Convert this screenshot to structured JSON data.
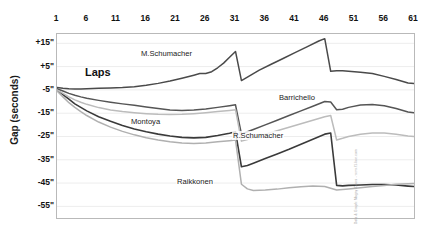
{
  "chart_data": {
    "type": "line",
    "title": "",
    "xlabel": "Laps",
    "ylabel": "Gap (seconds)",
    "xticks": [
      1,
      6,
      11,
      16,
      21,
      26,
      31,
      36,
      41,
      46,
      51,
      56,
      61
    ],
    "xtick_labels": [
      "1",
      "6",
      "11",
      "16",
      "21",
      "26",
      "31",
      "36",
      "41",
      "46",
      "51",
      "56",
      "61"
    ],
    "yticks": [
      15,
      5,
      -5,
      -15,
      -25,
      -35,
      -45,
      -55
    ],
    "ytick_labels": [
      "+15\"",
      "+5\"",
      "-5\"",
      "-15\"",
      "-25\"",
      "-35\"",
      "-45\"",
      "-55\""
    ],
    "xlim": [
      1,
      61
    ],
    "ylim": [
      -60,
      19
    ],
    "grid": true,
    "legend": "inline-annotations",
    "credit": "Data & Graph: Magny-Cours  -  www.f1-live.com",
    "series": [
      {
        "name": "M.Schumacher",
        "color": "#4a4a4a",
        "width": 1.5,
        "label_x": 140,
        "label_y": 49,
        "x": [
          1,
          2,
          3,
          4,
          5,
          6,
          8,
          10,
          12,
          14,
          16,
          18,
          20,
          22,
          24,
          25,
          26,
          27,
          28,
          29,
          30,
          31,
          32,
          33,
          34,
          35,
          37,
          39,
          41,
          43,
          45,
          46,
          47,
          48,
          49,
          50,
          52,
          54,
          56,
          58,
          60,
          61
        ],
        "y": [
          -4,
          -4.3,
          -4.5,
          -4.6,
          -4.6,
          -4.5,
          -4.3,
          -4.2,
          -4,
          -3.6,
          -3,
          -2.2,
          -1.2,
          0,
          1.3,
          2,
          2,
          2.8,
          4.5,
          6.5,
          9,
          11.5,
          -1,
          0.5,
          2,
          3.5,
          6,
          8.5,
          11,
          13.5,
          16,
          17,
          3,
          3.2,
          3.2,
          3,
          2.6,
          2,
          0.8,
          -0.5,
          -2,
          -2.3
        ]
      },
      {
        "name": "Barrichello",
        "color": "#555555",
        "width": 1.5,
        "label_x": 278,
        "label_y": 93,
        "x": [
          1,
          2,
          3,
          4,
          5,
          6,
          8,
          10,
          12,
          14,
          16,
          18,
          20,
          22,
          24,
          26,
          28,
          30,
          31,
          32,
          33,
          34,
          36,
          38,
          40,
          42,
          44,
          46,
          47,
          48,
          49,
          50,
          52,
          54,
          56,
          58,
          60,
          61
        ],
        "y": [
          -4.5,
          -5.5,
          -6.5,
          -7.3,
          -8,
          -8.6,
          -9.5,
          -10.3,
          -11,
          -11.6,
          -12.3,
          -13,
          -13.6,
          -13.8,
          -13.6,
          -13.2,
          -12.5,
          -11.8,
          -11.4,
          -24,
          -23,
          -22,
          -20,
          -18,
          -16,
          -14,
          -12,
          -10,
          -10.2,
          -13.5,
          -13.3,
          -12.5,
          -11.5,
          -11.3,
          -11.8,
          -13,
          -14.5,
          -14.8
        ]
      },
      {
        "name": "Montoya",
        "color": "#3a3a3a",
        "width": 1.6,
        "label_x": 130,
        "label_y": 117,
        "x": [
          1,
          2,
          3,
          4,
          5,
          6,
          8,
          10,
          12,
          14,
          16,
          18,
          20,
          22,
          24,
          26,
          28,
          30,
          31,
          32,
          33,
          34,
          36,
          38,
          40,
          42,
          44,
          46,
          47,
          48,
          49,
          50,
          52,
          54,
          56,
          58,
          60,
          61
        ],
        "y": [
          -5,
          -7,
          -9,
          -11,
          -12.5,
          -14,
          -16.5,
          -18.5,
          -20.3,
          -21.8,
          -23,
          -24,
          -24.8,
          -25.4,
          -25.6,
          -25.4,
          -24.6,
          -23.6,
          -23,
          -38,
          -37.5,
          -36.5,
          -34.5,
          -32.5,
          -30.5,
          -28.3,
          -26.2,
          -24,
          -23.5,
          -46,
          -46.2,
          -46,
          -45.8,
          -45.6,
          -45.6,
          -45.8,
          -46.3,
          -46.5
        ]
      },
      {
        "name": "R.Schumacher",
        "color": "#bcbcbc",
        "width": 1.5,
        "label_x": 232,
        "label_y": 131,
        "x": [
          1,
          2,
          3,
          4,
          5,
          6,
          8,
          10,
          12,
          14,
          16,
          18,
          20,
          22,
          24,
          26,
          28,
          30,
          31,
          32,
          33,
          34,
          36,
          38,
          40,
          42,
          44,
          46,
          47,
          48,
          49,
          50,
          52,
          54,
          56,
          58,
          60,
          61
        ],
        "y": [
          -5,
          -6.5,
          -8,
          -9.3,
          -10.3,
          -11.2,
          -12.6,
          -13.6,
          -14.3,
          -14.8,
          -15.2,
          -15.5,
          -15.6,
          -15.5,
          -15.2,
          -14.8,
          -14.3,
          -13.8,
          -13.5,
          -27,
          -26.3,
          -25.5,
          -24,
          -22.5,
          -21,
          -19.5,
          -18,
          -16.5,
          -16,
          -26.5,
          -25.8,
          -25,
          -24,
          -23.5,
          -23.5,
          -24,
          -24.8,
          -25
        ]
      },
      {
        "name": "Raikkonen",
        "color": "#b0b0b0",
        "width": 1.5,
        "label_x": 176,
        "label_y": 177,
        "x": [
          1,
          2,
          3,
          4,
          5,
          6,
          8,
          10,
          12,
          14,
          16,
          18,
          20,
          22,
          24,
          26,
          28,
          30,
          31,
          32,
          33,
          34,
          36,
          38,
          40,
          42,
          44,
          46,
          48,
          50,
          52,
          54,
          56,
          58,
          60,
          61
        ],
        "y": [
          -5.5,
          -8,
          -10.5,
          -12.5,
          -14.3,
          -16,
          -18.8,
          -21,
          -22.8,
          -24.3,
          -25.5,
          -26.5,
          -27.3,
          -27.8,
          -28,
          -27.8,
          -27.3,
          -26.8,
          -26.5,
          -45.5,
          -47.5,
          -48.2,
          -48,
          -47.6,
          -47,
          -46.6,
          -46.3,
          -46.5,
          -48,
          -47.5,
          -47,
          -46.5,
          -46,
          -45.5,
          -45.3,
          -45.2
        ]
      }
    ]
  }
}
